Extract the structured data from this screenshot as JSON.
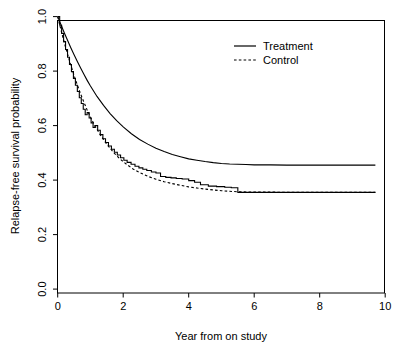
{
  "chart_data": {
    "type": "line",
    "title": "",
    "subtitle": "",
    "xlabel": "Year from on study",
    "ylabel": "Relapse-free survival probability",
    "xlim": [
      0,
      10
    ],
    "ylim": [
      0,
      1
    ],
    "xticks": [
      "0",
      "2",
      "4",
      "6",
      "8",
      "10"
    ],
    "xtick_values": [
      0,
      2,
      4,
      6,
      8,
      10
    ],
    "yticks": [
      "0.0",
      "0.2",
      "0.4",
      "0.6",
      "0.8",
      "1.0"
    ],
    "ytick_values": [
      0.0,
      0.2,
      0.4,
      0.6,
      0.8,
      1.0
    ],
    "grid": false,
    "legend_position": "top-right",
    "plot_style": "kaplan-meier survival curves (R base graphics)",
    "series": [
      {
        "name": "Treatment",
        "style": "solid",
        "linetype": "smooth",
        "plateau_value": 0.455,
        "x": [
          0.0,
          0.1,
          0.2,
          0.3,
          0.4,
          0.5,
          0.6,
          0.7,
          0.8,
          0.9,
          1.0,
          1.2,
          1.4,
          1.6,
          1.8,
          2.0,
          2.25,
          2.5,
          2.75,
          3.0,
          3.25,
          3.5,
          3.75,
          4.0,
          4.25,
          4.5,
          4.75,
          5.0,
          5.25,
          5.5,
          5.75,
          6.0,
          6.5,
          7.0,
          7.5,
          8.0,
          8.5,
          9.0,
          9.7
        ],
        "y": [
          1.0,
          0.97,
          0.941,
          0.913,
          0.886,
          0.86,
          0.835,
          0.811,
          0.788,
          0.766,
          0.745,
          0.707,
          0.674,
          0.644,
          0.618,
          0.595,
          0.57,
          0.549,
          0.532,
          0.517,
          0.505,
          0.494,
          0.486,
          0.478,
          0.473,
          0.468,
          0.464,
          0.461,
          0.459,
          0.458,
          0.457,
          0.456,
          0.456,
          0.455,
          0.455,
          0.455,
          0.455,
          0.455,
          0.455
        ]
      },
      {
        "name": "Control",
        "style": "dashed",
        "linetype": "smooth",
        "plateau_value": 0.355,
        "x": [
          0.0,
          0.1,
          0.2,
          0.3,
          0.4,
          0.5,
          0.6,
          0.7,
          0.8,
          0.9,
          1.0,
          1.15,
          1.3,
          1.5,
          1.7,
          1.9,
          2.1,
          2.3,
          2.5,
          2.75,
          3.0,
          3.25,
          3.5,
          3.75,
          4.0,
          4.25,
          4.5,
          4.75,
          5.0,
          5.25,
          5.5,
          6.0,
          6.5,
          7.0,
          7.5,
          8.0,
          8.5,
          9.0,
          9.7
        ],
        "y": [
          1.0,
          0.951,
          0.905,
          0.862,
          0.822,
          0.784,
          0.749,
          0.716,
          0.686,
          0.657,
          0.631,
          0.596,
          0.566,
          0.531,
          0.502,
          0.478,
          0.458,
          0.441,
          0.428,
          0.414,
          0.403,
          0.394,
          0.387,
          0.381,
          0.375,
          0.371,
          0.367,
          0.364,
          0.361,
          0.359,
          0.357,
          0.356,
          0.356,
          0.355,
          0.355,
          0.355,
          0.355,
          0.355,
          0.355
        ]
      },
      {
        "name": "Control (Kaplan-Meier estimate)",
        "style": "solid-step",
        "linetype": "step",
        "plateau_value": 0.355,
        "x": [
          0.0,
          0.06,
          0.12,
          0.18,
          0.24,
          0.3,
          0.36,
          0.42,
          0.48,
          0.54,
          0.6,
          0.66,
          0.72,
          0.78,
          0.84,
          0.9,
          0.96,
          1.02,
          1.08,
          1.14,
          1.22,
          1.3,
          1.38,
          1.46,
          1.55,
          1.64,
          1.73,
          1.82,
          1.92,
          2.02,
          2.12,
          2.24,
          2.36,
          2.48,
          2.6,
          2.72,
          2.86,
          3.0,
          3.14,
          3.3,
          3.46,
          3.62,
          3.8,
          4.0,
          4.18,
          4.36,
          4.6,
          4.85,
          5.1,
          5.3,
          5.5,
          9.7
        ],
        "y": [
          1.0,
          0.968,
          0.938,
          0.908,
          0.879,
          0.851,
          0.824,
          0.798,
          0.773,
          0.748,
          0.725,
          0.702,
          0.681,
          0.66,
          0.64,
          0.648,
          0.628,
          0.61,
          0.593,
          0.6,
          0.583,
          0.567,
          0.552,
          0.538,
          0.525,
          0.513,
          0.502,
          0.492,
          0.482,
          0.473,
          0.465,
          0.458,
          0.451,
          0.445,
          0.44,
          0.435,
          0.43,
          0.426,
          0.413,
          0.41,
          0.408,
          0.406,
          0.404,
          0.398,
          0.392,
          0.383,
          0.378,
          0.376,
          0.374,
          0.372,
          0.355,
          0.355
        ]
      }
    ],
    "annotations": []
  },
  "legend": {
    "items": [
      {
        "label": "Treatment",
        "style": "solid"
      },
      {
        "label": "Control",
        "style": "dashed"
      }
    ]
  },
  "axes": {
    "x_title": "Year from on study",
    "y_title": "Relapse-free survival probability"
  }
}
